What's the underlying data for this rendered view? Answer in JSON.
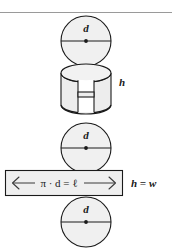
{
  "figure": {
    "colors": {
      "fill": "#f0f0f0",
      "fill_shade": "#e6e6e6",
      "stroke": "#1a1a1a",
      "rule": "#9a9a9a",
      "background": "#ffffff",
      "rect_fill": "#efefef"
    },
    "top_rule": {
      "present": true
    },
    "parts": {
      "top_circle": {
        "label": "d",
        "has_diameter_line": true,
        "has_center_dot": true
      },
      "cylinder": {
        "label": "h",
        "description": "cylinder with front slit opened"
      },
      "middle_circle": {
        "label": "d",
        "has_diameter_line": true,
        "has_center_dot": true
      },
      "rectangle": {
        "formula": "π · d = ℓ",
        "left_arrow": "⟵",
        "right_arrow": "⟶",
        "side_label": "h = w"
      },
      "bottom_circle": {
        "label": "d",
        "has_diameter_line": true,
        "has_center_dot": true
      }
    }
  }
}
